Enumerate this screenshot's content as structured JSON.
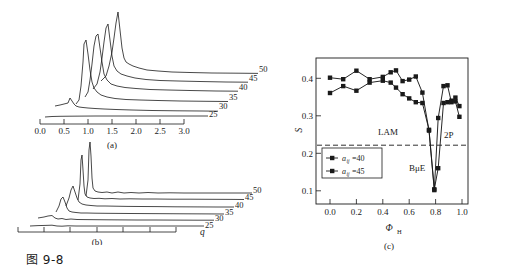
{
  "figure": {
    "caption": "图 9-8",
    "panels": [
      "(a)",
      "(b)",
      "(c)"
    ]
  },
  "chart_data": [
    {
      "type": "line",
      "panel": "(a)",
      "title": "",
      "xlabel": "",
      "ylabel": "",
      "xlim": [
        0.0,
        3.0
      ],
      "ylim": [
        0,
        1
      ],
      "grid": false,
      "xticks": [
        "0.0",
        "0.5",
        "1.0",
        "1.5",
        "2.0",
        "2.5",
        "3.0"
      ],
      "yticks": [],
      "series_labels": [
        "25",
        "30",
        "35",
        "40",
        "45",
        "50"
      ],
      "legend_position": "right-inline-offset",
      "series": [
        {
          "name": "25",
          "peak_q": 0.6,
          "peak_height": 0.1,
          "baseline": 0.02,
          "x_start": 0.22,
          "x_end": 2.55
        },
        {
          "name": "30",
          "peak_q": 0.62,
          "peak_height": 0.16,
          "baseline": 0.05,
          "x_start": 0.3,
          "x_end": 2.35
        },
        {
          "name": "35",
          "peak_q": 0.72,
          "peak_height": 0.34,
          "baseline": 0.09,
          "x_start": 0.38,
          "x_end": 2.15
        },
        {
          "name": "40",
          "peak_q": 0.8,
          "peak_height": 0.56,
          "baseline": 0.13,
          "x_start": 0.45,
          "x_end": 1.98
        },
        {
          "name": "45",
          "peak_q": 0.92,
          "peak_height": 0.72,
          "baseline": 0.17,
          "x_start": 0.52,
          "x_end": 1.8
        },
        {
          "name": "50",
          "peak_q": 1.12,
          "peak_height": 0.92,
          "baseline": 0.21,
          "x_start": 0.6,
          "x_end": 1.62
        }
      ]
    },
    {
      "type": "line",
      "panel": "(b)",
      "title": "",
      "xlabel": "q",
      "ylabel": "",
      "xlim": [
        0.0,
        3.0
      ],
      "ylim": [
        0,
        1
      ],
      "grid": false,
      "xticks": [],
      "yticks": [],
      "series_labels": [
        "25",
        "30",
        "35",
        "40",
        "45",
        "50"
      ],
      "legend_position": "right-inline-offset",
      "series": [
        {
          "name": "25",
          "peak_q": 0.52,
          "peak_height": 0.08,
          "baseline": 0.02,
          "x_start": 0.22,
          "x_end": 2.5
        },
        {
          "name": "30",
          "peak_q": 0.54,
          "peak_height": 0.16,
          "baseline": 0.05,
          "x_start": 0.28,
          "x_end": 2.32
        },
        {
          "name": "35",
          "peak_q": 0.58,
          "peak_height": 0.34,
          "baseline": 0.09,
          "x_start": 0.34,
          "x_end": 2.14
        },
        {
          "name": "40",
          "peak_q": 0.6,
          "peak_height": 0.54,
          "baseline": 0.13,
          "x_start": 0.4,
          "x_end": 1.96
        },
        {
          "name": "45",
          "peak_q": 0.72,
          "peak_height": 0.86,
          "baseline": 0.17,
          "x_start": 0.46,
          "x_end": 1.78
        },
        {
          "name": "50",
          "peak_q": 0.84,
          "peak_height": 0.96,
          "baseline": 0.21,
          "x_start": 0.52,
          "x_end": 1.6
        }
      ]
    },
    {
      "type": "line",
      "panel": "(c)",
      "title": "",
      "xlabel": "ΦH",
      "ylabel": "S",
      "xlim": [
        -0.03,
        1.03
      ],
      "ylim": [
        0.07,
        0.44
      ],
      "grid": false,
      "xticks": [
        "0.0",
        "0.2",
        "0.4",
        "0.6",
        "0.8",
        "1.0"
      ],
      "yticks": [
        "0.1",
        "0.2",
        "0.3",
        "0.4"
      ],
      "legend_position": "lower-left",
      "annotations": [
        {
          "text": "LAM",
          "x": 0.44,
          "y": 0.245
        },
        {
          "text": "2P",
          "x": 0.9,
          "y": 0.238
        },
        {
          "text": "BμE",
          "x": 0.66,
          "y": 0.15
        }
      ],
      "reference_line": {
        "type": "dashed-horizontal",
        "y": 0.218
      },
      "series": [
        {
          "name": "aij=40",
          "marker": "square",
          "x": [
            0.0,
            0.1,
            0.2,
            0.3,
            0.4,
            0.46,
            0.5,
            0.55,
            0.6,
            0.65,
            0.7,
            0.75,
            0.79,
            0.82,
            0.86,
            0.89,
            0.92,
            0.95,
            0.98
          ],
          "y": [
            0.354,
            0.372,
            0.36,
            0.381,
            0.386,
            0.381,
            0.368,
            0.351,
            0.34,
            0.33,
            0.328,
            0.258,
            0.103,
            0.158,
            0.328,
            0.33,
            0.334,
            0.332,
            0.292
          ]
        },
        {
          "name": "aij=45",
          "marker": "square",
          "x": [
            0.0,
            0.1,
            0.2,
            0.3,
            0.4,
            0.46,
            0.5,
            0.55,
            0.6,
            0.65,
            0.7,
            0.75,
            0.79,
            0.82,
            0.86,
            0.89,
            0.92,
            0.95,
            0.98
          ],
          "y": [
            0.394,
            0.39,
            0.412,
            0.39,
            0.396,
            0.408,
            0.413,
            0.385,
            0.389,
            0.397,
            0.355,
            0.256,
            0.101,
            0.289,
            0.372,
            0.374,
            0.33,
            0.342,
            0.32
          ]
        }
      ],
      "legend": [
        {
          "label": "aᵢⱼ=40",
          "marker": "square-line"
        },
        {
          "label": "aᵢⱼ=45",
          "marker": "square-line"
        }
      ]
    }
  ],
  "panel_a": {
    "label": "(a)",
    "xticks": [
      "0.0",
      "0.5",
      "1.0",
      "1.5",
      "2.0",
      "2.5",
      "3.0"
    ],
    "curve_labels": [
      "25",
      "30",
      "35",
      "40",
      "45",
      "50"
    ]
  },
  "panel_b": {
    "label": "(b)",
    "axis_label": "q",
    "curve_labels": [
      "25",
      "30",
      "35",
      "40",
      "45",
      "50"
    ]
  },
  "panel_c": {
    "label": "(c)",
    "ylabel": "S",
    "xlabel_main": "Φ",
    "xlabel_sub": "H",
    "xticks": [
      "0.0",
      "0.2",
      "0.4",
      "0.6",
      "0.8",
      "1.0"
    ],
    "yticks": [
      "0.1",
      "0.2",
      "0.3",
      "0.4"
    ],
    "annotation_lam": "LAM",
    "annotation_2p": "2P",
    "annotation_bue": "BμE",
    "legend_item_1_var": "a",
    "legend_item_1_sub": "ij",
    "legend_item_1_val": "=40",
    "legend_item_2_var": "a",
    "legend_item_2_sub": "ij",
    "legend_item_2_val": "=45"
  }
}
